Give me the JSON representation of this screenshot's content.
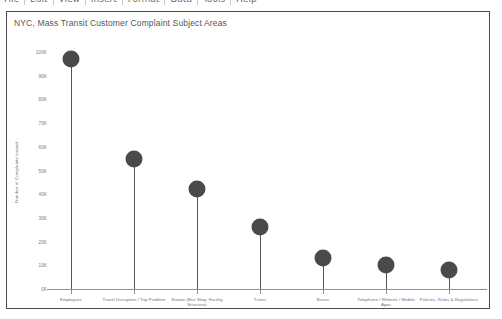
{
  "toolbar": {
    "items": [
      "File",
      "Edit",
      "View",
      "Insert",
      "Format",
      "Data",
      "Tools",
      "Help"
    ]
  },
  "chart": {
    "title": "NYC, Mass Transit Customer Complaint Subject Areas"
  },
  "chart_data": {
    "type": "bar",
    "title": "NYC, Mass Transit Customer Complaint Subject Areas",
    "xlabel": "",
    "ylabel": "Number of Complaints Issued",
    "ylim": [
      0,
      100000
    ],
    "grid": false,
    "legend": "none",
    "ytick_labels": [
      "100K",
      "90K",
      "80K",
      "70K",
      "60K",
      "50K",
      "40K",
      "30K",
      "20K",
      "10K",
      "0K"
    ],
    "ytick_values": [
      100000,
      90000,
      80000,
      70000,
      60000,
      50000,
      40000,
      30000,
      20000,
      10000,
      0
    ],
    "categories": [
      "Employees",
      "Travel Disruption / Trip Problem",
      "Station (Bus Stop, Facility Structure)",
      "Trains",
      "Buses",
      "Telephone / Website / Mobile Apps",
      "Policies, Rules & Regulations"
    ],
    "values": [
      97000,
      55000,
      42000,
      26000,
      13000,
      10000,
      8000
    ],
    "marker_color": "#4a4a4a",
    "stem_color": "#555555"
  }
}
